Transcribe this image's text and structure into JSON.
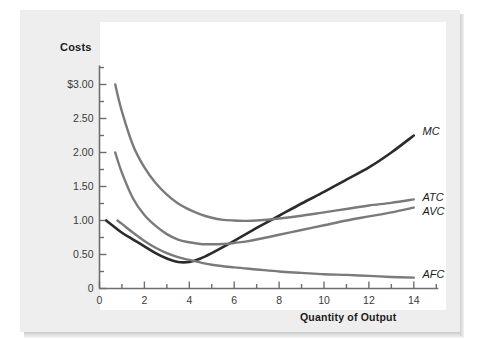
{
  "figure": {
    "background_color": "#eeeeee",
    "plot_background_color": "#ffffff"
  },
  "chart_data": {
    "type": "line",
    "title": "",
    "xlabel": "Quantity of Output",
    "ylabel": "Costs",
    "xlim": [
      0,
      15
    ],
    "ylim": [
      0,
      3.25
    ],
    "grid": false,
    "legend_position": "right-of-curve-ends",
    "x_ticks": [
      0,
      2,
      4,
      6,
      8,
      10,
      12,
      14
    ],
    "x_tick_labels": [
      "0",
      "2",
      "4",
      "6",
      "8",
      "10",
      "12",
      "14"
    ],
    "x_minor_tick_interval": 1,
    "y_ticks": [
      0,
      0.5,
      1.0,
      1.5,
      2.0,
      2.5,
      3.0
    ],
    "y_tick_labels": [
      "0",
      "0.50",
      "1.00",
      "1.50",
      "2.00",
      "2.50",
      "$3.00"
    ],
    "y_minor_tick_interval": 0.25,
    "series": [
      {
        "name": "MC",
        "label": "MC",
        "color": "#2b2b2b",
        "linewidth": 2.6,
        "x": [
          0.3,
          1.0,
          1.5,
          2.0,
          2.5,
          3.0,
          3.5,
          4.0,
          4.5,
          5.0,
          6.0,
          7.0,
          8.0,
          9.0,
          10.0,
          11.0,
          12.0,
          13.0,
          14.0
        ],
        "y": [
          1.0,
          0.82,
          0.72,
          0.62,
          0.52,
          0.44,
          0.39,
          0.39,
          0.44,
          0.52,
          0.7,
          0.89,
          1.07,
          1.25,
          1.42,
          1.6,
          1.78,
          2.0,
          2.25
        ]
      },
      {
        "name": "ATC",
        "label": "ATC",
        "color": "#7a7a7a",
        "linewidth": 2.4,
        "x": [
          0.7,
          1.0,
          1.5,
          2.0,
          2.5,
          3.0,
          3.5,
          4.0,
          4.5,
          5.0,
          5.5,
          6.0,
          6.5,
          7.0,
          8.0,
          9.0,
          10.0,
          11.0,
          12.0,
          13.0,
          14.0
        ],
        "y": [
          3.0,
          2.6,
          2.1,
          1.78,
          1.55,
          1.38,
          1.25,
          1.16,
          1.09,
          1.04,
          1.01,
          1.0,
          0.995,
          1.0,
          1.03,
          1.07,
          1.12,
          1.17,
          1.22,
          1.26,
          1.31
        ]
      },
      {
        "name": "AVC",
        "label": "AVC",
        "color": "#7a7a7a",
        "linewidth": 2.4,
        "x": [
          0.7,
          1.0,
          1.5,
          2.0,
          2.5,
          3.0,
          3.5,
          4.0,
          4.5,
          5.0,
          5.5,
          6.0,
          6.5,
          7.0,
          8.0,
          9.0,
          10.0,
          11.0,
          12.0,
          13.0,
          14.0
        ],
        "y": [
          2.0,
          1.7,
          1.32,
          1.08,
          0.92,
          0.8,
          0.72,
          0.68,
          0.655,
          0.65,
          0.655,
          0.67,
          0.69,
          0.72,
          0.79,
          0.86,
          0.93,
          1.0,
          1.06,
          1.12,
          1.19
        ]
      },
      {
        "name": "AFC",
        "label": "AFC",
        "color": "#7a7a7a",
        "linewidth": 2.4,
        "x": [
          0.8,
          1.0,
          1.5,
          2.0,
          2.5,
          3.0,
          3.5,
          4.0,
          5.0,
          6.0,
          7.0,
          8.0,
          9.0,
          10.0,
          11.0,
          12.0,
          13.0,
          14.0
        ],
        "y": [
          1.0,
          0.95,
          0.82,
          0.7,
          0.6,
          0.52,
          0.46,
          0.42,
          0.35,
          0.31,
          0.28,
          0.25,
          0.23,
          0.21,
          0.2,
          0.185,
          0.17,
          0.16
        ]
      }
    ],
    "annotations": [
      {
        "text": "MC",
        "x": 14.3,
        "y": 2.3
      },
      {
        "text": "ATC",
        "x": 14.3,
        "y": 1.33
      },
      {
        "text": "AVC",
        "x": 14.3,
        "y": 1.13
      },
      {
        "text": "AFC",
        "x": 14.3,
        "y": 0.2
      }
    ]
  }
}
